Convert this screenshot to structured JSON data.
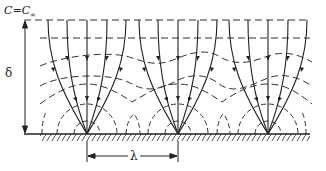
{
  "diagram": {
    "labels": {
      "concentration_far_field": "C=C",
      "concentration_subscript": "∞",
      "boundary_layer_thickness": "δ",
      "sink_spacing": "λ"
    },
    "sinks": [
      {
        "x": 87,
        "y": 134
      },
      {
        "x": 178,
        "y": 134
      },
      {
        "x": 268,
        "y": 134
      }
    ],
    "colors": {
      "ink": "#222222",
      "background": "#ffffff"
    },
    "elements": {
      "solid_lines": "flux lines converging to point sinks, with arrows",
      "dashed_lines": "iso-concentration contours",
      "hatched_baseline": "solid wall / substrate"
    }
  }
}
